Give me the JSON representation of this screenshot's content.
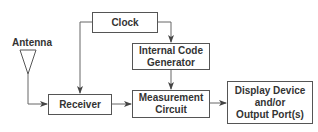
{
  "diagram": {
    "type": "block-diagram",
    "nodes": [
      {
        "id": "antenna",
        "label": "Antenna"
      },
      {
        "id": "clock",
        "label": "Clock"
      },
      {
        "id": "code_gen",
        "label": "Internal Code Generator",
        "lines": [
          "Internal Code",
          "Generator"
        ]
      },
      {
        "id": "receiver",
        "label": "Receiver"
      },
      {
        "id": "measurement",
        "label": "Measurement Circuit",
        "lines": [
          "Measurement",
          "Circuit"
        ]
      },
      {
        "id": "display",
        "label": "Display Device and/or Output Port(s)",
        "lines": [
          "Display Device",
          "and/or",
          "Output Port(s)"
        ]
      }
    ],
    "edges": [
      {
        "from": "antenna",
        "to": "receiver"
      },
      {
        "from": "clock",
        "to": "receiver"
      },
      {
        "from": "clock",
        "to": "code_gen"
      },
      {
        "from": "code_gen",
        "to": "measurement"
      },
      {
        "from": "receiver",
        "to": "measurement"
      },
      {
        "from": "measurement",
        "to": "display"
      }
    ],
    "colors": {
      "line": "#555555",
      "text": "#333333",
      "background": "#ffffff"
    }
  }
}
